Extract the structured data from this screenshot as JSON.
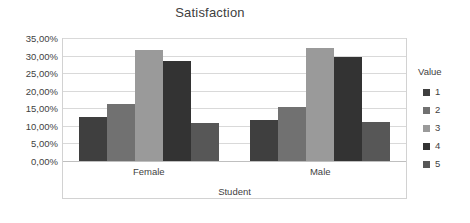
{
  "chart_data": {
    "type": "bar",
    "title": "Satisfaction",
    "xlabel": "Student",
    "ylabel": "",
    "categories": [
      "Female",
      "Male"
    ],
    "series": [
      {
        "name": "1",
        "values": [
          12.4,
          11.6
        ],
        "color": "#3f3f3f"
      },
      {
        "name": "2",
        "values": [
          16.2,
          15.4
        ],
        "color": "#717171"
      },
      {
        "name": "3",
        "values": [
          31.6,
          32.1
        ],
        "color": "#9a9a9a"
      },
      {
        "name": "4",
        "values": [
          28.6,
          29.7
        ],
        "color": "#333333"
      },
      {
        "name": "5",
        "values": [
          10.7,
          11.1
        ],
        "color": "#575757"
      }
    ],
    "ylim": [
      0,
      35
    ],
    "ytick_values": [
      0,
      5,
      10,
      15,
      20,
      25,
      30,
      35
    ],
    "ytick_labels": [
      "0,00%",
      "5,00%",
      "10,00%",
      "15,00%",
      "20,00%",
      "25,00%",
      "30,00%",
      "35,00%"
    ],
    "grid": true,
    "legend_position": "right",
    "legend_title": "Value",
    "value_unit": "%"
  },
  "legend": {
    "title": "Value",
    "items": [
      {
        "label": "1",
        "color": "#3f3f3f"
      },
      {
        "label": "2",
        "color": "#717171"
      },
      {
        "label": "3",
        "color": "#9a9a9a"
      },
      {
        "label": "4",
        "color": "#333333"
      },
      {
        "label": "5",
        "color": "#575757"
      }
    ]
  },
  "colors": {
    "background": "#ffffff",
    "text": "#3f3f3f",
    "gridline": "#d9d9d9",
    "axis_line": "#bfbfbf",
    "plot_border": "#d2d2d2"
  }
}
